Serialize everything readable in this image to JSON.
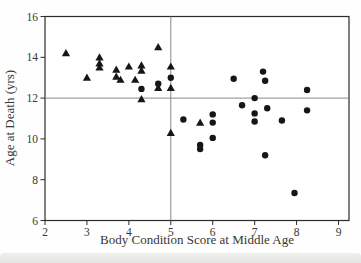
{
  "chart_data": {
    "type": "scatter",
    "title": "",
    "xlabel": "Body Condition Score at Middle Age",
    "ylabel": "Age at Death (yrs)",
    "xlim": [
      2,
      9.25
    ],
    "ylim": [
      6,
      16
    ],
    "x_ticks": [
      2,
      3,
      4,
      5,
      6,
      7,
      8,
      9
    ],
    "y_ticks": [
      6,
      8,
      10,
      12,
      14,
      16
    ],
    "grid": false,
    "legend": false,
    "reference_lines": {
      "x": 5,
      "y": 12
    },
    "series": [
      {
        "name": "triangles",
        "marker": "triangle",
        "color": "#161616",
        "points": [
          [
            2.5,
            14.2
          ],
          [
            3.0,
            13.0
          ],
          [
            3.3,
            14.0
          ],
          [
            3.3,
            13.7
          ],
          [
            3.3,
            13.5
          ],
          [
            3.7,
            13.4
          ],
          [
            3.7,
            13.05
          ],
          [
            3.8,
            12.9
          ],
          [
            4.0,
            13.55
          ],
          [
            4.3,
            13.6
          ],
          [
            4.3,
            13.35
          ],
          [
            4.15,
            12.9
          ],
          [
            4.3,
            11.95
          ],
          [
            4.7,
            14.5
          ],
          [
            4.7,
            12.5
          ],
          [
            5.0,
            13.55
          ],
          [
            5.0,
            12.5
          ],
          [
            5.0,
            10.3
          ],
          [
            5.7,
            10.8
          ]
        ]
      },
      {
        "name": "circles",
        "marker": "circle",
        "color": "#161616",
        "points": [
          [
            4.3,
            12.45
          ],
          [
            4.7,
            12.7
          ],
          [
            5.0,
            13.0
          ],
          [
            5.3,
            10.95
          ],
          [
            5.7,
            9.7
          ],
          [
            5.7,
            9.5
          ],
          [
            6.0,
            11.2
          ],
          [
            6.0,
            10.8
          ],
          [
            6.0,
            10.05
          ],
          [
            6.5,
            12.95
          ],
          [
            6.7,
            11.65
          ],
          [
            7.0,
            12.0
          ],
          [
            7.0,
            11.25
          ],
          [
            7.0,
            10.85
          ],
          [
            7.2,
            13.3
          ],
          [
            7.25,
            12.85
          ],
          [
            7.3,
            11.5
          ],
          [
            7.25,
            9.2
          ],
          [
            7.65,
            10.9
          ],
          [
            7.95,
            7.35
          ],
          [
            8.25,
            12.4
          ],
          [
            8.25,
            11.4
          ]
        ]
      }
    ]
  },
  "colors": {
    "axis": "#2b2b2b",
    "reference_line": "#7d7d7d",
    "marker": "#161616",
    "text": "#3a3632",
    "page_band": "#e7e7e3"
  }
}
